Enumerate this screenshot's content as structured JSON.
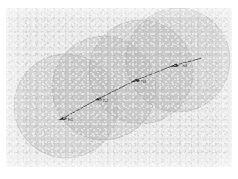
{
  "figure": {
    "title": "",
    "panel_background_color": "#e9e9e9",
    "page_background_color": "#ffffff",
    "circle_fill_color": "#b9b9b9",
    "circle_stroke_color": "#a2a2a2",
    "trajectory_color": "#3a3a3a",
    "marker_color": "#2b2b2b"
  },
  "chart_data": {
    "type": "scatter",
    "title": "",
    "subtitle": "",
    "xlabel": "",
    "ylabel": "",
    "grid": false,
    "legend": null,
    "axis_ticks_visible": false,
    "coverage_circles": [
      {
        "id": "circle-1",
        "cx": 60,
        "cy": 98,
        "r": 52
      },
      {
        "id": "circle-2",
        "cx": 98,
        "cy": 80,
        "r": 52
      },
      {
        "id": "circle-3",
        "cx": 135,
        "cy": 64,
        "r": 52
      },
      {
        "id": "circle-4",
        "cx": 172,
        "cy": 52,
        "r": 52
      }
    ],
    "trajectory": {
      "points": [
        {
          "x": 54,
          "y": 112
        },
        {
          "x": 90,
          "y": 92
        },
        {
          "x": 128,
          "y": 73
        },
        {
          "x": 166,
          "y": 58
        },
        {
          "x": 196,
          "y": 50
        }
      ]
    },
    "waypoints": [
      {
        "id": "waypoint-1",
        "label": "R1",
        "x": 56,
        "y": 110,
        "label_x": 62,
        "label_y": 113
      },
      {
        "id": "waypoint-2",
        "label": "R2",
        "x": 91,
        "y": 91,
        "label_x": 97,
        "label_y": 94
      },
      {
        "id": "waypoint-3",
        "label": "R3",
        "x": 129,
        "y": 72,
        "label_x": 135,
        "label_y": 75
      },
      {
        "id": "waypoint-4",
        "label": "R4",
        "x": 168,
        "y": 57,
        "label_x": 176,
        "label_y": 59
      }
    ]
  }
}
